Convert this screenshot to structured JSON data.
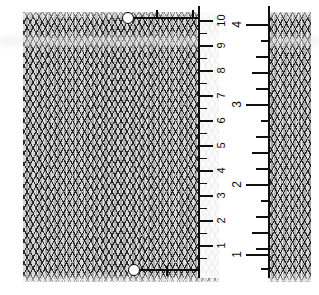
{
  "image": {
    "subject": "knitted-stockinette-fabric-with-ruler",
    "background_color": "#ffffff"
  },
  "fabric": {
    "left_swatch_name": "knit-fabric-main",
    "right_swatch_name": "knit-fabric-edge",
    "base_color": "#c8c8c8",
    "stitch_outline_color": "#141414",
    "highlight_color": "#ffffff"
  },
  "ruler": {
    "name": "transparent-measuring-ruler",
    "body_color": "#ffffff",
    "edge_color": "#101010",
    "orientation": "vertical-rotated-90",
    "metric": {
      "unit": "cm",
      "labels": [
        "1",
        "2",
        "3",
        "4",
        "5",
        "6",
        "7",
        "8",
        "9",
        "10"
      ],
      "values": [
        1,
        2,
        3,
        4,
        5,
        6,
        7,
        8,
        9,
        10
      ],
      "minor_ticks_per_unit": 1
    },
    "imperial": {
      "unit": "in",
      "labels": [
        "1",
        "2",
        "3",
        "4"
      ],
      "values": [
        1,
        2,
        3,
        4
      ],
      "subdivisions": 4
    }
  },
  "markers": [
    {
      "name": "measurement-marker-top",
      "label": "",
      "dot_color": "#ffffff",
      "line_color": "#0a0a0a"
    },
    {
      "name": "measurement-marker-bottom",
      "label": "",
      "dot_color": "#ffffff",
      "line_color": "#0a0a0a"
    }
  ]
}
